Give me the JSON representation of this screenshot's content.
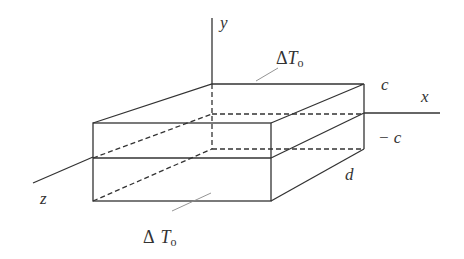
{
  "diagram": {
    "axes": {
      "x": {
        "label": "x"
      },
      "y": {
        "label": "y"
      },
      "z": {
        "label": "z"
      }
    },
    "dimension_labels": {
      "top": "c",
      "bottom": "− c",
      "depth": "d"
    },
    "face_labels": {
      "top": {
        "delta": "Δ",
        "symbol": "T",
        "subscript": "o"
      },
      "bottom": {
        "delta": "Δ",
        "symbol": "T",
        "subscript": "o"
      }
    },
    "colors": {
      "line": "#333333",
      "leader": "#888888",
      "background": "#ffffff"
    }
  }
}
